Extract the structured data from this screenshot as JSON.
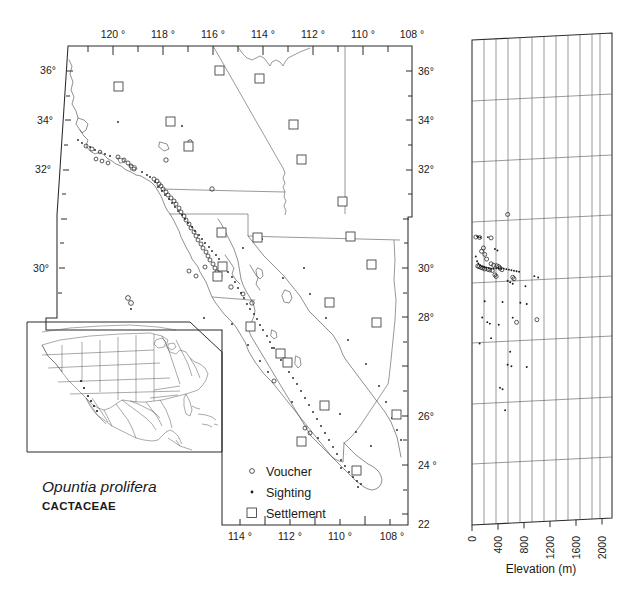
{
  "figure": {
    "taxon": "Opuntia prolifera",
    "family": "CACTACEAE"
  },
  "main_map": {
    "name": "distribution-map",
    "top_axis_labels": [
      "120 °",
      "118 °",
      "116 °",
      "114 °",
      "112 °",
      "110 °",
      "108 °"
    ],
    "bottom_axis_labels": [
      "114 °",
      "112 °",
      "110 °",
      "108 °"
    ],
    "left_axis_labels": [
      "36°",
      "34°",
      "32°",
      "30°"
    ],
    "right_axis_labels": [
      "36°",
      "34°",
      "32°",
      "30°",
      "28°",
      "26°",
      "24 °",
      "22"
    ]
  },
  "legend": {
    "name": "symbol-legend",
    "items": [
      {
        "symbol": "open-circle",
        "label": "Voucher"
      },
      {
        "symbol": "filled-dot",
        "label": "Sighting"
      },
      {
        "symbol": "open-square",
        "label": "Settlement"
      }
    ]
  },
  "inset": {
    "name": "north-america-inset",
    "description": "North America locator map"
  },
  "chart_data": {
    "type": "scatter",
    "title": "",
    "xlabel": "Elevation (m)",
    "ylabel": "",
    "xlim": [
      0,
      2200
    ],
    "ylim": [
      22,
      37
    ],
    "grid": true,
    "xticks": [
      0,
      400,
      800,
      1200,
      1600,
      2000
    ],
    "xtick_labels": [
      "0",
      "400",
      "800",
      "1200",
      "1600",
      "2000"
    ],
    "yticks": [
      36,
      34,
      32,
      30,
      28,
      26,
      24,
      22
    ],
    "ytick_labels": [
      "36°",
      "34°",
      "32°",
      "30°",
      "28°",
      "26°",
      "24 °",
      "22"
    ],
    "series": [
      {
        "name": "Voucher",
        "symbol": "open-circle",
        "points": [
          [
            560,
            31.55
          ],
          [
            300,
            30.85
          ],
          [
            60,
            30.9
          ],
          [
            120,
            30.88
          ],
          [
            180,
            30.55
          ],
          [
            150,
            30.45
          ],
          [
            200,
            30.35
          ],
          [
            230,
            30.2
          ],
          [
            300,
            30.05
          ],
          [
            340,
            30.0
          ],
          [
            390,
            29.98
          ],
          [
            420,
            29.95
          ],
          [
            440,
            29.9
          ],
          [
            470,
            29.85
          ],
          [
            360,
            29.7
          ],
          [
            380,
            29.65
          ],
          [
            640,
            29.6
          ],
          [
            660,
            29.55
          ],
          [
            90,
            30.0
          ],
          [
            110,
            29.98
          ],
          [
            140,
            29.95
          ],
          [
            170,
            29.93
          ],
          [
            200,
            29.9
          ],
          [
            250,
            29.88
          ],
          [
            280,
            29.86
          ],
          [
            320,
            29.84
          ],
          [
            1020,
            28.25
          ],
          [
            700,
            28.2
          ]
        ]
      },
      {
        "name": "Sighting",
        "symbol": "filled-dot",
        "points": [
          [
            80,
            30.92
          ],
          [
            100,
            30.9
          ],
          [
            130,
            30.88
          ],
          [
            250,
            30.88
          ],
          [
            60,
            30.3
          ],
          [
            80,
            30.15
          ],
          [
            100,
            30.08
          ],
          [
            130,
            30.02
          ],
          [
            160,
            29.98
          ],
          [
            190,
            29.96
          ],
          [
            220,
            29.94
          ],
          [
            260,
            29.92
          ],
          [
            300,
            29.9
          ],
          [
            340,
            29.9
          ],
          [
            380,
            29.9
          ],
          [
            420,
            29.9
          ],
          [
            460,
            29.88
          ],
          [
            500,
            29.88
          ],
          [
            540,
            29.86
          ],
          [
            580,
            29.84
          ],
          [
            620,
            29.82
          ],
          [
            660,
            29.8
          ],
          [
            700,
            29.78
          ],
          [
            740,
            29.76
          ],
          [
            560,
            29.5
          ],
          [
            600,
            29.45
          ],
          [
            640,
            29.4
          ],
          [
            840,
            29.3
          ],
          [
            200,
            28.9
          ],
          [
            480,
            28.85
          ],
          [
            760,
            28.8
          ],
          [
            860,
            28.75
          ],
          [
            160,
            28.4
          ],
          [
            640,
            28.35
          ],
          [
            240,
            28.25
          ],
          [
            280,
            28.2
          ],
          [
            420,
            28.15
          ],
          [
            300,
            27.75
          ],
          [
            600,
            27.3
          ],
          [
            560,
            26.9
          ],
          [
            620,
            26.85
          ],
          [
            860,
            26.8
          ],
          [
            440,
            26.2
          ],
          [
            480,
            26.15
          ],
          [
            520,
            25.5
          ],
          [
            980,
            29.6
          ],
          [
            1040,
            29.55
          ],
          [
            120,
            27.6
          ],
          [
            360,
            30.5
          ],
          [
            400,
            30.45
          ]
        ]
      }
    ]
  },
  "elevation_panel": {
    "name": "elevation-scatter-panel",
    "axis_title": "Elevation (m)"
  }
}
